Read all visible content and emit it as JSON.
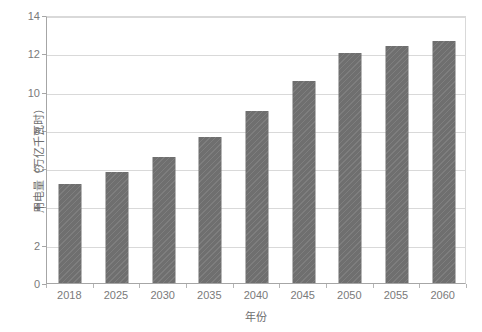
{
  "chart_data": {
    "type": "bar",
    "title": "",
    "subtitle": "",
    "xlabel": "年份",
    "ylabel": "用电量（万亿千瓦时）",
    "categories": [
      "2018",
      "2025",
      "2030",
      "2035",
      "2040",
      "2045",
      "2050",
      "2055",
      "2060"
    ],
    "values": [
      5.15,
      5.8,
      6.6,
      7.65,
      9.0,
      10.55,
      12.0,
      12.4,
      12.65
    ],
    "series": [
      {
        "name": "用电量",
        "values": [
          5.15,
          5.8,
          6.6,
          7.65,
          9.0,
          10.55,
          12.0,
          12.4,
          12.65
        ]
      }
    ],
    "ylim": [
      0,
      14
    ],
    "yticks": [
      0,
      2,
      4,
      6,
      8,
      10,
      12,
      14
    ],
    "ytick_labels": [
      "0",
      "2",
      "4",
      "6",
      "8",
      "10",
      "12",
      "14"
    ],
    "grid": true,
    "grid_axis": "y",
    "legend": false,
    "legend_position": "none",
    "bar_color": "#6f6f6f",
    "gridline_color": "#d9d9d9",
    "axis_color": "#a6a6a6",
    "text_color": "#7a7a7a",
    "background_color": "#ffffff",
    "annotations": []
  }
}
